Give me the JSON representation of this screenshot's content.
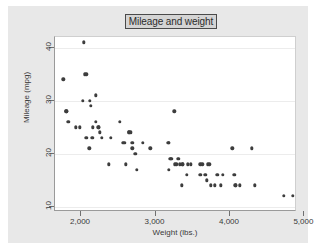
{
  "chart_data": {
    "type": "scatter",
    "title": "Mileage and weight",
    "xlabel": "Weight (lbs.)",
    "ylabel": "Mileage (mpg)",
    "xlim": [
      1650,
      4900
    ],
    "ylim": [
      9,
      42
    ],
    "xticks": [
      2000,
      3000,
      4000,
      5000
    ],
    "xticklabels": [
      "2,000",
      "3,000",
      "4,000",
      "5,000"
    ],
    "yticks": [
      10,
      20,
      30,
      40
    ],
    "yticklabels": [
      "10",
      "20",
      "30",
      "40"
    ],
    "grid": "horizontal",
    "legend": "none",
    "marker_color": "#3d3d3d",
    "plot_background": "#ffffff",
    "graph_background": "#e8e8e8",
    "n_points": 74,
    "points": [
      {
        "x": 1760,
        "y": 34
      },
      {
        "x": 1800,
        "y": 28
      },
      {
        "x": 1800,
        "y": 28
      },
      {
        "x": 1830,
        "y": 26
      },
      {
        "x": 1930,
        "y": 25
      },
      {
        "x": 1980,
        "y": 25
      },
      {
        "x": 2020,
        "y": 30
      },
      {
        "x": 2040,
        "y": 41
      },
      {
        "x": 2050,
        "y": 35
      },
      {
        "x": 2070,
        "y": 35
      },
      {
        "x": 2070,
        "y": 23
      },
      {
        "x": 2110,
        "y": 21
      },
      {
        "x": 2120,
        "y": 30
      },
      {
        "x": 2130,
        "y": 29
      },
      {
        "x": 2150,
        "y": 23
      },
      {
        "x": 2160,
        "y": 25
      },
      {
        "x": 2200,
        "y": 31
      },
      {
        "x": 2200,
        "y": 26
      },
      {
        "x": 2230,
        "y": 25
      },
      {
        "x": 2240,
        "y": 25
      },
      {
        "x": 2250,
        "y": 24
      },
      {
        "x": 2280,
        "y": 23
      },
      {
        "x": 2370,
        "y": 18
      },
      {
        "x": 2400,
        "y": 23
      },
      {
        "x": 2520,
        "y": 26
      },
      {
        "x": 2560,
        "y": 22
      },
      {
        "x": 2580,
        "y": 22
      },
      {
        "x": 2600,
        "y": 18
      },
      {
        "x": 2640,
        "y": 24
      },
      {
        "x": 2650,
        "y": 24
      },
      {
        "x": 2670,
        "y": 24
      },
      {
        "x": 2690,
        "y": 21
      },
      {
        "x": 2690,
        "y": 22
      },
      {
        "x": 2730,
        "y": 20
      },
      {
        "x": 2750,
        "y": 17
      },
      {
        "x": 2830,
        "y": 22
      },
      {
        "x": 2930,
        "y": 21
      },
      {
        "x": 3170,
        "y": 22
      },
      {
        "x": 3180,
        "y": 22
      },
      {
        "x": 3180,
        "y": 17
      },
      {
        "x": 3200,
        "y": 19
      },
      {
        "x": 3210,
        "y": 19
      },
      {
        "x": 3250,
        "y": 28
      },
      {
        "x": 3260,
        "y": 18
      },
      {
        "x": 3280,
        "y": 18
      },
      {
        "x": 3300,
        "y": 19
      },
      {
        "x": 3310,
        "y": 19
      },
      {
        "x": 3330,
        "y": 18
      },
      {
        "x": 3350,
        "y": 14
      },
      {
        "x": 3360,
        "y": 18
      },
      {
        "x": 3370,
        "y": 18
      },
      {
        "x": 3420,
        "y": 16
      },
      {
        "x": 3430,
        "y": 18
      },
      {
        "x": 3470,
        "y": 18
      },
      {
        "x": 3600,
        "y": 16
      },
      {
        "x": 3600,
        "y": 18
      },
      {
        "x": 3630,
        "y": 18
      },
      {
        "x": 3670,
        "y": 16
      },
      {
        "x": 3690,
        "y": 15
      },
      {
        "x": 3700,
        "y": 18
      },
      {
        "x": 3720,
        "y": 18
      },
      {
        "x": 3740,
        "y": 14
      },
      {
        "x": 3800,
        "y": 14
      },
      {
        "x": 3830,
        "y": 16
      },
      {
        "x": 3880,
        "y": 14
      },
      {
        "x": 3900,
        "y": 16
      },
      {
        "x": 4030,
        "y": 21
      },
      {
        "x": 4060,
        "y": 16
      },
      {
        "x": 4070,
        "y": 14
      },
      {
        "x": 4080,
        "y": 14
      },
      {
        "x": 4130,
        "y": 14
      },
      {
        "x": 4290,
        "y": 21
      },
      {
        "x": 4330,
        "y": 14
      },
      {
        "x": 4720,
        "y": 12
      },
      {
        "x": 4840,
        "y": 12
      }
    ]
  }
}
